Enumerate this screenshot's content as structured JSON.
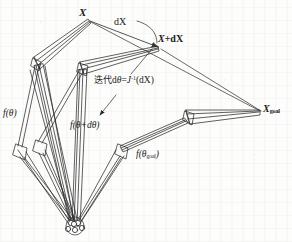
{
  "figure": {
    "caption_absent": true,
    "domain_note": "robot-arm inverse kinematics iteration diagram",
    "labels": {
      "x": "X",
      "dx": "dX",
      "x_plus_dx_prefix": "X",
      "x_plus_dx_suffix": "+dX",
      "x_goal_base": "X",
      "x_goal_sub": "goal",
      "iteration_cjk": "迭代",
      "iteration_formula_d": "d",
      "iteration_formula_theta": "θ",
      "iteration_formula_eq": "=",
      "iteration_formula_J": "J",
      "iteration_formula_exp": "-1",
      "iteration_formula_arg": "(dX)",
      "f_theta": "f(θ)",
      "f_theta_dtheta": "f(θ+dθ)",
      "f_theta_goal_base": "f(θ",
      "f_theta_goal_sub": "goal",
      "f_theta_goal_close": ")"
    },
    "colors": {
      "ink": "#1a1a1a",
      "stroke": "#2b2b2b",
      "paper": "#fdfdfc",
      "arrowhead_fill": "#3a3a3a"
    },
    "geometry": {
      "point_X": [
        90,
        20
      ],
      "point_X_plus_dX": [
        160,
        48
      ],
      "point_X_goal": [
        262,
        112
      ],
      "base_joint_cluster": [
        75,
        225
      ],
      "chains": [
        {
          "name": "chain-theta",
          "end_effector": [
            90,
            20
          ],
          "elbow": [
            38,
            63
          ],
          "mid": [
            18,
            152
          ]
        },
        {
          "name": "chain-theta-dtheta",
          "end_effector": [
            160,
            48
          ],
          "elbow": [
            82,
            68
          ],
          "mid": [
            40,
            148
          ]
        },
        {
          "name": "chain-theta-goal",
          "end_effector": [
            262,
            112
          ],
          "elbow": [
            190,
            118
          ],
          "mid": [
            120,
            152
          ]
        }
      ]
    }
  }
}
